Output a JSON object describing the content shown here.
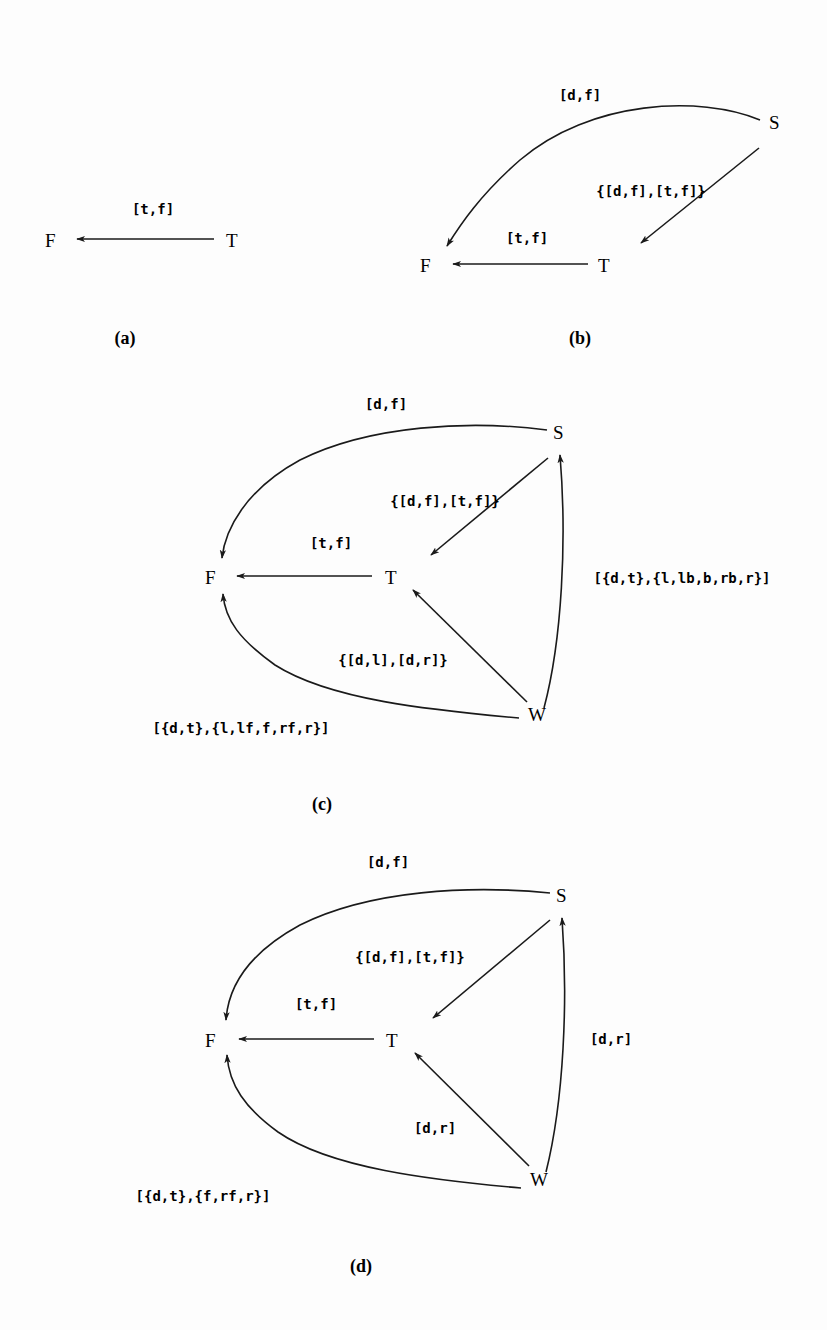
{
  "figure": {
    "panels": [
      {
        "caption": "(a)",
        "nodes": {
          "F": "F",
          "T": "T"
        },
        "edges": [
          {
            "from": "T",
            "to": "F",
            "label": "[t,f]"
          }
        ]
      },
      {
        "caption": "(b)",
        "nodes": {
          "S": "S",
          "F": "F",
          "T": "T"
        },
        "edges": [
          {
            "from": "S",
            "to": "F",
            "label": "[d,f]"
          },
          {
            "from": "S",
            "to": "T",
            "label": "{[d,f],[t,f]}"
          },
          {
            "from": "T",
            "to": "F",
            "label": "[t,f]"
          }
        ]
      },
      {
        "caption": "(c)",
        "nodes": {
          "S": "S",
          "F": "F",
          "T": "T",
          "W": "W"
        },
        "edges": [
          {
            "from": "S",
            "to": "F",
            "label": "[d,f]"
          },
          {
            "from": "S",
            "to": "T",
            "label": "{[d,f],[t,f]}"
          },
          {
            "from": "T",
            "to": "F",
            "label": "[t,f]"
          },
          {
            "from": "W",
            "to": "S",
            "label": "[{d,t},{l,lb,b,rb,r}]"
          },
          {
            "from": "W",
            "to": "T",
            "label": "{[d,l],[d,r]}"
          },
          {
            "from": "W",
            "to": "F",
            "label": "[{d,t},{l,lf,f,rf,r}]"
          }
        ]
      },
      {
        "caption": "(d)",
        "nodes": {
          "S": "S",
          "F": "F",
          "T": "T",
          "W": "W"
        },
        "edges": [
          {
            "from": "S",
            "to": "F",
            "label": "[d,f]"
          },
          {
            "from": "S",
            "to": "T",
            "label": "{[d,f],[t,f]}"
          },
          {
            "from": "T",
            "to": "F",
            "label": "[t,f]"
          },
          {
            "from": "W",
            "to": "S",
            "label": "[d,r]"
          },
          {
            "from": "W",
            "to": "T",
            "label": "[d,r]"
          },
          {
            "from": "W",
            "to": "F",
            "label": "[{d,t},{f,rf,r}]"
          }
        ]
      }
    ]
  }
}
